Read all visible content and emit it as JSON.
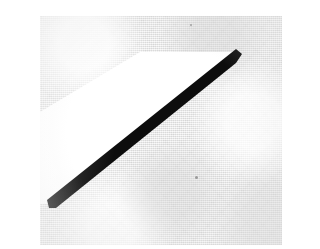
{
  "image": {
    "title": "Scanned diagonal stroke on textured paper",
    "caption": "",
    "width": 242,
    "height": 229,
    "background_color": "#eaeaea",
    "white_color": "#ffffff",
    "stroke_color": "#0d0d0d",
    "speck_color": "#9a9a9a",
    "texture": "halftone-dither"
  },
  "shapes": {
    "background": {
      "name": "paper background",
      "color": "#eaeaea"
    },
    "white_region": {
      "name": "white highlight wedge",
      "color": "#ffffff",
      "points": "100,36 196,36 196,44 18,188 0,188 0,96"
    },
    "black_stroke": {
      "name": "bold black diagonal stroke",
      "color": "#0d0d0d",
      "points": "196,33 202,38 196,47 16,192 9,192 7,184"
    }
  },
  "specks": [
    {
      "label": "speck-upper",
      "x": 150,
      "y": 8,
      "size": 2
    },
    {
      "label": "speck-lower",
      "x": 155,
      "y": 160,
      "size": 3
    }
  ]
}
